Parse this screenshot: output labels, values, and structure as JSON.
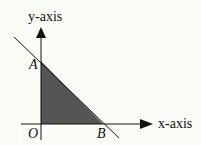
{
  "diagram": {
    "axes": {
      "x_label": "x-axis",
      "y_label": "y-axis"
    },
    "points": [
      {
        "name": "O",
        "label": "O",
        "role": "origin"
      },
      {
        "name": "A",
        "label": "A",
        "role": "y-intercept"
      },
      {
        "name": "B",
        "label": "B",
        "role": "x-intercept"
      }
    ],
    "shaded_region": {
      "vertices": [
        "O",
        "A",
        "B"
      ],
      "color": "#555555"
    },
    "line": {
      "through": [
        "A",
        "B"
      ],
      "color": "#111111"
    }
  }
}
